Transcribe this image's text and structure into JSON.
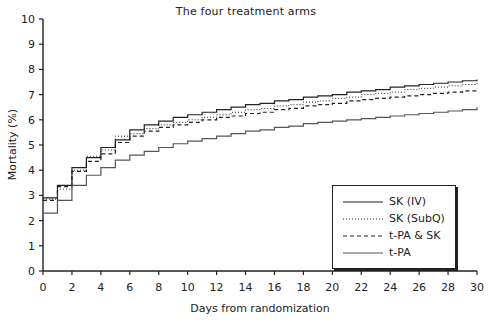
{
  "chart_data": {
    "type": "line",
    "step": true,
    "title": "The four treatment arms",
    "xlabel": "Days from randomization",
    "ylabel": "Mortality (%)",
    "xlim": [
      0,
      30
    ],
    "ylim": [
      0,
      10
    ],
    "xticks": [
      0,
      2,
      4,
      6,
      8,
      10,
      12,
      14,
      16,
      18,
      20,
      22,
      24,
      26,
      28,
      30
    ],
    "yticks": [
      0,
      1,
      2,
      3,
      4,
      5,
      6,
      7,
      8,
      9,
      10
    ],
    "grid": false,
    "legend_position": "lower right (inside)",
    "x": [
      0,
      1,
      2,
      3,
      4,
      5,
      6,
      7,
      8,
      9,
      10,
      11,
      12,
      13,
      14,
      15,
      16,
      17,
      18,
      19,
      20,
      21,
      22,
      23,
      24,
      25,
      26,
      27,
      28,
      29,
      30
    ],
    "series": [
      {
        "name": "SK (IV)",
        "style": "solid",
        "color": "#222222",
        "values": [
          2.9,
          3.4,
          4.1,
          4.5,
          4.9,
          5.2,
          5.6,
          5.8,
          5.95,
          6.1,
          6.2,
          6.3,
          6.4,
          6.5,
          6.6,
          6.65,
          6.75,
          6.8,
          6.9,
          6.95,
          7.0,
          7.1,
          7.15,
          7.2,
          7.3,
          7.35,
          7.4,
          7.45,
          7.5,
          7.55,
          7.6
        ]
      },
      {
        "name": "SK (SubQ)",
        "style": "dotted",
        "color": "#222222",
        "values": [
          2.85,
          3.25,
          4.0,
          4.55,
          4.8,
          5.35,
          5.45,
          5.65,
          5.8,
          5.9,
          6.0,
          6.1,
          6.2,
          6.3,
          6.4,
          6.45,
          6.55,
          6.6,
          6.7,
          6.75,
          6.85,
          6.9,
          7.0,
          7.05,
          7.1,
          7.2,
          7.25,
          7.3,
          7.35,
          7.4,
          7.45
        ]
      },
      {
        "name": "t-PA & SK",
        "style": "dashed",
        "color": "#222222",
        "values": [
          2.8,
          3.35,
          3.95,
          4.35,
          4.65,
          5.1,
          5.35,
          5.55,
          5.7,
          5.8,
          5.9,
          6.0,
          6.1,
          6.15,
          6.25,
          6.3,
          6.4,
          6.45,
          6.55,
          6.6,
          6.65,
          6.75,
          6.8,
          6.85,
          6.9,
          6.95,
          7.0,
          7.05,
          7.1,
          7.15,
          7.25
        ]
      },
      {
        "name": "t-PA",
        "style": "solid",
        "color": "#555555",
        "values": [
          2.3,
          2.8,
          3.4,
          3.8,
          4.1,
          4.4,
          4.6,
          4.75,
          4.9,
          5.05,
          5.15,
          5.25,
          5.35,
          5.45,
          5.55,
          5.6,
          5.7,
          5.75,
          5.85,
          5.9,
          5.95,
          6.0,
          6.05,
          6.1,
          6.15,
          6.2,
          6.25,
          6.3,
          6.35,
          6.4,
          6.5
        ]
      }
    ]
  }
}
